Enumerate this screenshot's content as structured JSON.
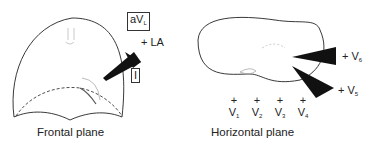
{
  "frontal": {
    "caption": "Frontal plane",
    "box_avl_main": "aV",
    "box_avl_sub": "L",
    "label_la": "+ LA",
    "box_i": "I"
  },
  "horizontal": {
    "caption": "Horizontal plane",
    "v6_main": "+ V",
    "v6_sub": "6",
    "v5_main": "+ V",
    "v5_sub": "5",
    "precordial": [
      {
        "plus": "+",
        "main": "V",
        "sub": "1"
      },
      {
        "plus": "+",
        "main": "V",
        "sub": "2"
      },
      {
        "plus": "+",
        "main": "V",
        "sub": "3"
      },
      {
        "plus": "+",
        "main": "V",
        "sub": "4"
      }
    ]
  }
}
